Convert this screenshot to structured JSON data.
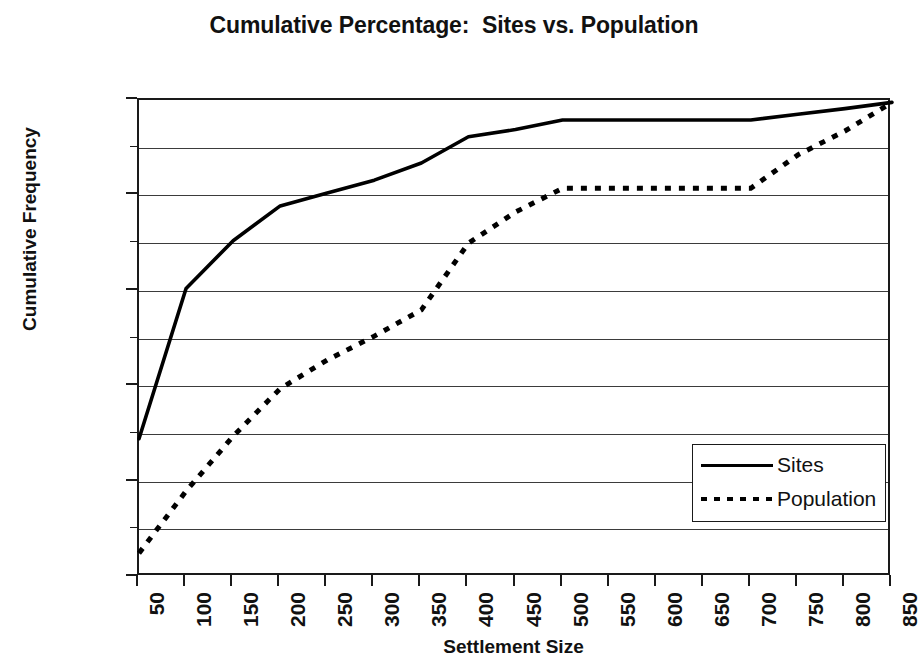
{
  "chart_data": {
    "type": "line",
    "title": "Cumulative Percentage:  Sites vs. Population",
    "xlabel": "Settlement Size",
    "ylabel": "Cumulative Frequency",
    "grid": true,
    "legend_position": "inside-bottom-right",
    "xlim": [
      50,
      850
    ],
    "ylim": [
      0,
      100
    ],
    "y_tick_labels": [
      "0.0%",
      "20.0%",
      "40.0%",
      "60.0%",
      "80.0%",
      "100.0%"
    ],
    "y_ticks": [
      0,
      20,
      40,
      60,
      80,
      100
    ],
    "y_minor_ticks": [
      10,
      30,
      50,
      70,
      90
    ],
    "categories": [
      50,
      100,
      150,
      200,
      250,
      300,
      350,
      400,
      450,
      500,
      550,
      600,
      650,
      700,
      750,
      800,
      850
    ],
    "x_tick_labels": [
      "50",
      "100",
      "150",
      "200",
      "250",
      "300",
      "350",
      "400",
      "450",
      "500",
      "550",
      "600",
      "650",
      "700",
      "750",
      "800",
      "850"
    ],
    "series": [
      {
        "name": "Sites",
        "style": "solid",
        "color": "#000000",
        "values": [
          29.0,
          60.5,
          70.5,
          77.8,
          80.5,
          83.2,
          86.8,
          92.3,
          93.8,
          95.8,
          95.8,
          95.8,
          95.8,
          95.8,
          97.0,
          98.2,
          99.5
        ]
      },
      {
        "name": "Population",
        "style": "dotted",
        "color": "#000000",
        "values": [
          5.0,
          18.0,
          29.5,
          39.5,
          45.5,
          50.5,
          56.0,
          70.0,
          76.5,
          81.5,
          81.5,
          81.5,
          81.5,
          81.5,
          88.5,
          93.5,
          99.5
        ]
      }
    ]
  },
  "legend": {
    "entries": [
      {
        "label": "Sites"
      },
      {
        "label": "Population"
      }
    ]
  }
}
